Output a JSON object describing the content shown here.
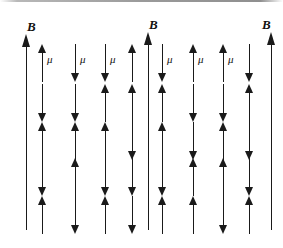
{
  "figure": {
    "background_color": "#ffffff",
    "ink_color": "#1a1a1a",
    "width": 283,
    "height": 248
  },
  "field_arrows": [
    {
      "id": "left",
      "label": "B",
      "x": 20,
      "label_x": 27,
      "label_y": 20,
      "top": 34,
      "height": 196
    },
    {
      "id": "middle",
      "label": "B",
      "x": 142,
      "label_x": 149,
      "label_y": 18,
      "top": 32,
      "height": 198
    },
    {
      "id": "right",
      "label": "B",
      "x": 265,
      "label_x": 262,
      "label_y": 18,
      "top": 32,
      "height": 198
    }
  ],
  "mu_symbol": "μ",
  "panels": [
    {
      "id": "left-panel",
      "name": "left-dipole-panel",
      "columns_x": [
        38,
        71,
        101,
        128
      ],
      "rows_y": [
        44,
        84,
        122,
        158,
        196
      ],
      "rows": [
        {
          "directions": [
            "up",
            "down",
            "down",
            "up"
          ],
          "mu_labels": [
            true,
            true,
            true,
            false
          ]
        },
        {
          "directions": [
            "down",
            "down",
            "up",
            "up"
          ],
          "mu_labels": [
            false,
            false,
            false,
            false
          ]
        },
        {
          "directions": [
            "up",
            "up",
            "up",
            "down"
          ],
          "mu_labels": [
            false,
            false,
            false,
            false
          ]
        },
        {
          "directions": [
            "down",
            "up",
            "down",
            "down"
          ],
          "mu_labels": [
            false,
            false,
            false,
            false
          ]
        },
        {
          "directions": [
            "up",
            "down",
            "up",
            "down"
          ],
          "mu_labels": [
            false,
            false,
            false,
            false
          ]
        }
      ]
    },
    {
      "id": "right-panel",
      "name": "right-dipole-panel",
      "columns_x": [
        158,
        189,
        219,
        245
      ],
      "rows_y": [
        44,
        84,
        122,
        158,
        196
      ],
      "rows": [
        {
          "directions": [
            "down",
            "up",
            "up",
            "down"
          ],
          "mu_labels": [
            true,
            true,
            true,
            false
          ]
        },
        {
          "directions": [
            "up",
            "down",
            "down",
            "up"
          ],
          "mu_labels": [
            false,
            false,
            false,
            false
          ]
        },
        {
          "directions": [
            "up",
            "down",
            "up",
            "down"
          ],
          "mu_labels": [
            false,
            false,
            false,
            false
          ]
        },
        {
          "directions": [
            "down",
            "up",
            "up",
            "down"
          ],
          "mu_labels": [
            false,
            false,
            false,
            false
          ]
        },
        {
          "directions": [
            "up",
            "up",
            "down",
            "up"
          ],
          "mu_labels": [
            false,
            false,
            false,
            false
          ]
        }
      ]
    }
  ]
}
